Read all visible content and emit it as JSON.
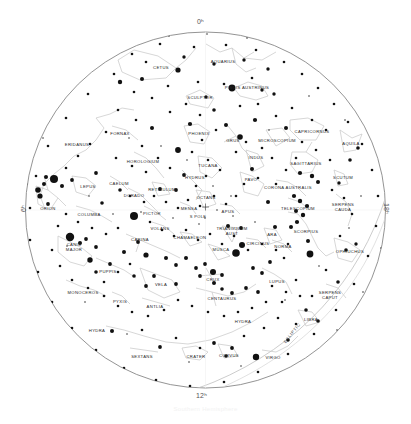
{
  "chart_data": {
    "type": "scatter",
    "projection": "polar-azimuthal",
    "center": "South Celestial Pole",
    "xlabel": "",
    "ylabel": "",
    "grid": true,
    "legend": "none",
    "ra_axis_labels": [
      {
        "id": "ra0",
        "text": "0ʰ",
        "position": "top"
      },
      {
        "id": "ra6",
        "text": "6ʰ",
        "position": "left"
      },
      {
        "id": "ra12",
        "text": "12ʰ",
        "position": "bottom"
      },
      {
        "id": "ra18",
        "text": "18ʰ",
        "position": "right"
      }
    ],
    "annotations": [
      {
        "name": "ecliptic",
        "text": "ECLIPTIC"
      },
      {
        "name": "south-pole",
        "text": "S POLE"
      }
    ],
    "constellations": [
      {
        "label": "CETUS",
        "x": 161,
        "y": 68,
        "lines": 1
      },
      {
        "label": "AQUARIUS",
        "x": 223,
        "y": 62,
        "lines": 1
      },
      {
        "label": "SCULPTOR",
        "x": 200,
        "y": 98,
        "lines": 1
      },
      {
        "label": "PISCIS AUSTRINUS",
        "x": 247,
        "y": 88,
        "lines": 1
      },
      {
        "label": "FORNAX",
        "x": 120,
        "y": 134,
        "lines": 1
      },
      {
        "label": "ERIDANUS",
        "x": 77,
        "y": 145,
        "lines": 1
      },
      {
        "label": "PHOENIX",
        "x": 199,
        "y": 134,
        "lines": 1
      },
      {
        "label": "GRUS",
        "x": 233,
        "y": 141,
        "lines": 1
      },
      {
        "label": "MICROSCOPIUM",
        "x": 277,
        "y": 141,
        "lines": 1
      },
      {
        "label": "CAPRICORNUS",
        "x": 312,
        "y": 132,
        "lines": 1
      },
      {
        "label": "AQUILA",
        "x": 351,
        "y": 144,
        "lines": 1
      },
      {
        "label": "HOROLOGIUM",
        "x": 143,
        "y": 162,
        "lines": 1
      },
      {
        "label": "TUCANA",
        "x": 208,
        "y": 166,
        "lines": 1
      },
      {
        "label": "INDUS",
        "x": 256,
        "y": 158,
        "lines": 1
      },
      {
        "label": "SAGITTARIUS",
        "x": 306,
        "y": 164,
        "lines": 1
      },
      {
        "label": "SCUTUM",
        "x": 343,
        "y": 178,
        "lines": 1
      },
      {
        "label": "HYDRUS",
        "x": 195,
        "y": 178,
        "lines": 1
      },
      {
        "label": "PAVO",
        "x": 251,
        "y": 180,
        "lines": 1
      },
      {
        "label": "CAELUM",
        "x": 119,
        "y": 184,
        "lines": 1
      },
      {
        "label": "LEPUS",
        "x": 88,
        "y": 187,
        "lines": 1
      },
      {
        "label": "RETICULUM",
        "x": 162,
        "y": 190,
        "lines": 1
      },
      {
        "label": "CORONA AUSTRALIS",
        "x": 288,
        "y": 188,
        "lines": 1
      },
      {
        "label": "DORADO",
        "x": 134,
        "y": 196,
        "lines": 1
      },
      {
        "label": "OCTANS",
        "x": 206,
        "y": 198,
        "lines": 1
      },
      {
        "label": "SERPENS CAUDA",
        "x": 343,
        "y": 208,
        "lines": 2
      },
      {
        "label": "ORION",
        "x": 48,
        "y": 209,
        "lines": 1
      },
      {
        "label": "MENSA",
        "x": 189,
        "y": 209,
        "lines": 1
      },
      {
        "label": "APUS",
        "x": 228,
        "y": 212,
        "lines": 1
      },
      {
        "label": "TELESCOPIUM",
        "x": 298,
        "y": 209,
        "lines": 1
      },
      {
        "label": "PICTOR",
        "x": 152,
        "y": 214,
        "lines": 1
      },
      {
        "label": "COLUMBA",
        "x": 89,
        "y": 215,
        "lines": 1
      },
      {
        "label": "VOLANS",
        "x": 160,
        "y": 229,
        "lines": 1
      },
      {
        "label": "TRIANGULUM AUST",
        "x": 232,
        "y": 232,
        "lines": 2
      },
      {
        "label": "ARA",
        "x": 272,
        "y": 235,
        "lines": 1
      },
      {
        "label": "SCORPIUS",
        "x": 306,
        "y": 232,
        "lines": 1
      },
      {
        "label": "CHAMAELEON",
        "x": 190,
        "y": 238,
        "lines": 1
      },
      {
        "label": "CARINA",
        "x": 140,
        "y": 240,
        "lines": 1
      },
      {
        "label": "CIRCINUS",
        "x": 258,
        "y": 244,
        "lines": 1
      },
      {
        "label": "NORMA",
        "x": 283,
        "y": 247,
        "lines": 1
      },
      {
        "label": "MUSCA",
        "x": 221,
        "y": 250,
        "lines": 1
      },
      {
        "label": "OPHIUCHUS",
        "x": 350,
        "y": 252,
        "lines": 1
      },
      {
        "label": "CANIS MAJOR",
        "x": 74,
        "y": 248,
        "lines": 2
      },
      {
        "label": "PUPPIS",
        "x": 108,
        "y": 272,
        "lines": 1
      },
      {
        "label": "VELA",
        "x": 161,
        "y": 285,
        "lines": 1
      },
      {
        "label": "CRUX",
        "x": 213,
        "y": 280,
        "lines": 1
      },
      {
        "label": "LUPUS",
        "x": 277,
        "y": 282,
        "lines": 1
      },
      {
        "label": "MONOCEROS",
        "x": 83,
        "y": 293,
        "lines": 1
      },
      {
        "label": "CENTAURUS",
        "x": 222,
        "y": 299,
        "lines": 1
      },
      {
        "label": "SERPENS CAPUT",
        "x": 330,
        "y": 296,
        "lines": 2
      },
      {
        "label": "PYXIS",
        "x": 120,
        "y": 302,
        "lines": 1
      },
      {
        "label": "ANTLIA",
        "x": 155,
        "y": 307,
        "lines": 1
      },
      {
        "label": "HYDRA",
        "x": 243,
        "y": 322,
        "lines": 1
      },
      {
        "label": "LIBRA",
        "x": 311,
        "y": 320,
        "lines": 1
      },
      {
        "label": "HYDRA",
        "x": 97,
        "y": 331,
        "lines": 1
      },
      {
        "label": "SEXTANS",
        "x": 142,
        "y": 357,
        "lines": 1
      },
      {
        "label": "CRATER",
        "x": 196,
        "y": 357,
        "lines": 1
      },
      {
        "label": "CORVUS",
        "x": 229,
        "y": 356,
        "lines": 1
      },
      {
        "label": "VIRGO",
        "x": 273,
        "y": 358,
        "lines": 1
      }
    ],
    "star_magnitude_classes": [
      {
        "class": "mag0",
        "radius": 4.0
      },
      {
        "class": "mag1",
        "radius": 3.1
      },
      {
        "class": "mag2",
        "radius": 2.4
      },
      {
        "class": "mag3",
        "radius": 1.8
      },
      {
        "class": "mag4",
        "radius": 1.25
      },
      {
        "class": "mag5",
        "radius": 0.85
      }
    ]
  },
  "caption": {
    "text": "Southern Hemisphere"
  },
  "colors": {
    "background": "#ffffff",
    "star": "#111111",
    "constellation_line": "#c8c8c8",
    "horizon_circle": "#707070",
    "label": "#262626",
    "ecliptic": "#bdbdbd"
  }
}
